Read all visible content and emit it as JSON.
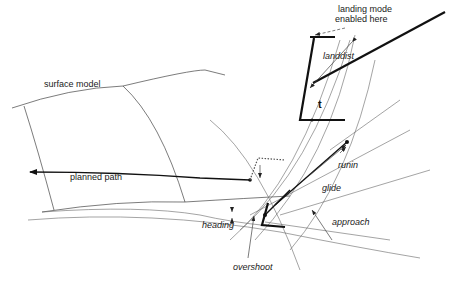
{
  "diagram": {
    "labels": {
      "landing_mode": "landing mode",
      "enabled_here": "enabled here",
      "landdist": "landdist",
      "t": "t",
      "surface_model": "surface model",
      "planned_path": "planned path",
      "runin": "runin",
      "glide": "glide",
      "approach": "approach",
      "heading": "heading",
      "overshoot": "overshoot"
    },
    "colors": {
      "line": "#111111",
      "thin_line": "#444444",
      "background": "#ffffff"
    }
  }
}
